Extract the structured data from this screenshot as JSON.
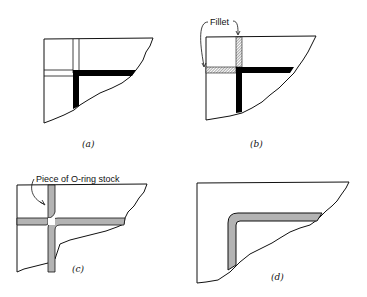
{
  "figure": {
    "panels": [
      {
        "id": "a",
        "caption": "(a)"
      },
      {
        "id": "b",
        "caption": "(b)",
        "annotation": "Fillet"
      },
      {
        "id": "c",
        "caption": "(c)",
        "annotation": "Piece of O-ring stock"
      },
      {
        "id": "d",
        "caption": "(d)"
      }
    ],
    "colors": {
      "line": "#111111",
      "groove_fill": "#000000",
      "oring_fill": "#b3b3b3",
      "hatch": "#555555",
      "background": "#ffffff"
    }
  }
}
